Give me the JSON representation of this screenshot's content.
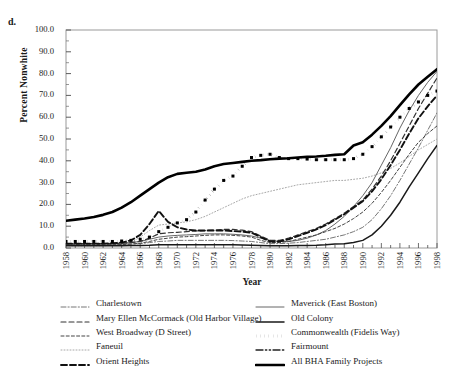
{
  "panel": {
    "label": "d."
  },
  "axes": {
    "ylabel": "Percent Nonwhite",
    "xlabel": "Year",
    "yticks": [
      "0.0",
      "10.0",
      "20.0",
      "30.0",
      "40.0",
      "50.0",
      "60.0",
      "70.0",
      "80.0",
      "90.0",
      "100.0"
    ],
    "xticks": [
      "1958",
      "1960",
      "1962",
      "1964",
      "1966",
      "1968",
      "1970",
      "1972",
      "1974",
      "1976",
      "1978",
      "1980",
      "1982",
      "1984",
      "1986",
      "1988",
      "1990",
      "1992",
      "1994",
      "1996",
      "1998"
    ]
  },
  "legend": {
    "left": [
      {
        "label": "Charlestown",
        "key": "dash-dot-thin"
      },
      {
        "label": "Mary Ellen McCormack (Old Harbor Village)",
        "key": "dash-medium"
      },
      {
        "label": "West Broadway (D Street)",
        "key": "dash-short"
      },
      {
        "label": "Faneuil",
        "key": "dotted-faint"
      },
      {
        "label": "Orient Heights",
        "key": "dash-bold"
      }
    ],
    "right": [
      {
        "label": "Maverick (East Boston)",
        "key": "solid-thin"
      },
      {
        "label": "Old Colony",
        "key": "solid-medium"
      },
      {
        "label": "Commonwealth (Fidelis Way)",
        "key": "dotted-bold"
      },
      {
        "label": "Fairmount",
        "key": "dash-dot-dot"
      },
      {
        "label": "All BHA Family Projects",
        "key": "solid-bold"
      }
    ]
  },
  "chart_data": {
    "type": "line",
    "title": "",
    "xlabel": "Year",
    "ylabel": "Percent Nonwhite",
    "xlim": [
      1958,
      1998
    ],
    "ylim": [
      0,
      100
    ],
    "ytick_step": 10,
    "xtick_step": 2,
    "grid": false,
    "legend_position": "below",
    "x": [
      1958,
      1959,
      1960,
      1961,
      1962,
      1963,
      1964,
      1965,
      1966,
      1967,
      1968,
      1969,
      1970,
      1971,
      1972,
      1973,
      1974,
      1975,
      1976,
      1977,
      1978,
      1979,
      1980,
      1981,
      1982,
      1983,
      1984,
      1985,
      1986,
      1987,
      1988,
      1989,
      1990,
      1991,
      1992,
      1993,
      1994,
      1995,
      1996,
      1997,
      1998
    ],
    "series": [
      {
        "name": "All BHA Family Projects",
        "style": "solid-bold",
        "values": [
          12.5,
          13.0,
          13.5,
          14.2,
          15.2,
          16.5,
          18.5,
          21.0,
          24.0,
          27.0,
          30.0,
          32.5,
          34.0,
          34.5,
          35.0,
          36.0,
          37.5,
          38.5,
          39.0,
          39.5,
          40.0,
          40.3,
          40.7,
          41.0,
          41.2,
          41.5,
          41.8,
          42.0,
          42.3,
          42.7,
          43.0,
          47.0,
          48.5,
          52.0,
          56.0,
          60.5,
          65.5,
          70.5,
          75.0,
          78.5,
          82.0
        ]
      },
      {
        "name": "Commonwealth (Fidelis Way)",
        "style": "dotted-bold",
        "values": [
          3.0,
          3.0,
          3.0,
          3.0,
          3.0,
          3.0,
          3.2,
          3.5,
          4.0,
          5.0,
          7.5,
          9.5,
          11.5,
          13.0,
          16.5,
          22.0,
          27.0,
          31.0,
          33.0,
          37.5,
          41.5,
          42.5,
          43.0,
          41.5,
          41.0,
          41.0,
          40.8,
          40.5,
          40.5,
          40.5,
          40.5,
          41.0,
          43.0,
          46.5,
          51.0,
          55.5,
          60.0,
          64.0,
          67.0,
          70.0,
          72.0
        ]
      },
      {
        "name": "Maverick (East Boston)",
        "style": "solid-thin",
        "values": [
          2.0,
          2.0,
          2.0,
          2.0,
          2.0,
          2.0,
          2.2,
          2.5,
          3.0,
          4.0,
          5.0,
          5.5,
          5.8,
          6.0,
          6.2,
          6.5,
          6.5,
          6.5,
          6.3,
          6.0,
          5.5,
          4.5,
          3.5,
          3.0,
          3.0,
          3.5,
          4.5,
          6.0,
          8.0,
          11.0,
          14.5,
          19.0,
          24.0,
          30.0,
          38.0,
          46.0,
          55.0,
          63.0,
          70.0,
          76.0,
          81.0
        ]
      },
      {
        "name": "Mary Ellen McCormack (Old Harbor Village)",
        "style": "dash-medium",
        "values": [
          2.0,
          2.0,
          2.0,
          2.0,
          2.0,
          2.0,
          2.2,
          2.5,
          3.0,
          4.5,
          6.5,
          7.0,
          7.2,
          7.5,
          7.8,
          8.0,
          8.2,
          8.5,
          8.5,
          8.2,
          7.5,
          5.5,
          3.5,
          3.5,
          4.5,
          6.0,
          7.5,
          9.0,
          11.0,
          13.5,
          16.0,
          19.0,
          22.0,
          27.0,
          33.0,
          40.0,
          48.0,
          56.0,
          64.0,
          71.0,
          78.0
        ]
      },
      {
        "name": "Orient Heights",
        "style": "dash-bold",
        "values": [
          2.0,
          2.0,
          2.0,
          2.0,
          2.0,
          2.2,
          2.5,
          3.5,
          6.0,
          11.0,
          17.0,
          12.0,
          9.5,
          8.5,
          8.0,
          8.0,
          8.0,
          8.0,
          7.8,
          7.5,
          7.0,
          5.0,
          3.0,
          3.0,
          4.0,
          5.5,
          7.0,
          8.5,
          10.5,
          13.0,
          15.5,
          18.5,
          21.5,
          26.0,
          31.5,
          38.0,
          45.0,
          52.5,
          59.5,
          65.0,
          70.0
        ]
      },
      {
        "name": "Charlestown",
        "style": "dash-dot-thin",
        "values": [
          1.5,
          1.5,
          1.5,
          1.5,
          1.5,
          1.5,
          1.6,
          1.8,
          2.0,
          2.5,
          3.0,
          3.2,
          3.5,
          3.5,
          3.5,
          3.5,
          3.5,
          3.5,
          3.4,
          3.2,
          3.0,
          2.5,
          2.0,
          2.0,
          2.2,
          2.5,
          3.0,
          3.5,
          4.0,
          5.0,
          6.0,
          7.5,
          9.5,
          13.0,
          18.0,
          24.0,
          31.0,
          38.5,
          46.0,
          54.0,
          62.0
        ]
      },
      {
        "name": "West Broadway (D Street)",
        "style": "dash-short",
        "values": [
          1.5,
          1.5,
          1.5,
          1.5,
          1.5,
          1.5,
          1.6,
          1.8,
          2.2,
          3.0,
          4.0,
          4.5,
          5.0,
          5.2,
          5.5,
          5.8,
          6.0,
          6.0,
          5.8,
          5.5,
          5.0,
          3.5,
          2.5,
          2.5,
          3.0,
          4.0,
          5.0,
          6.0,
          7.5,
          9.0,
          11.0,
          13.5,
          16.5,
          20.5,
          25.5,
          31.0,
          37.0,
          43.0,
          48.5,
          52.5,
          56.0
        ]
      },
      {
        "name": "Faneuil",
        "style": "dotted-faint",
        "values": [
          1.0,
          1.0,
          1.0,
          1.0,
          1.0,
          1.2,
          1.5,
          2.5,
          5.0,
          8.0,
          10.5,
          11.0,
          11.5,
          12.0,
          13.0,
          14.5,
          16.5,
          18.5,
          20.5,
          22.5,
          24.0,
          25.0,
          26.0,
          27.0,
          28.0,
          29.0,
          29.5,
          30.0,
          30.5,
          31.0,
          31.0,
          31.5,
          32.0,
          33.0,
          34.5,
          36.5,
          39.0,
          42.0,
          45.0,
          47.5,
          50.0
        ]
      },
      {
        "name": "Old Colony",
        "style": "solid-medium",
        "values": [
          1.0,
          1.0,
          1.0,
          1.0,
          1.0,
          1.0,
          1.0,
          1.1,
          1.2,
          1.3,
          1.5,
          1.5,
          1.5,
          1.5,
          1.5,
          1.5,
          1.5,
          1.5,
          1.5,
          1.4,
          1.3,
          1.2,
          1.0,
          1.0,
          1.0,
          1.1,
          1.2,
          1.3,
          1.5,
          1.8,
          2.0,
          2.5,
          3.5,
          6.0,
          10.0,
          15.0,
          21.0,
          28.0,
          34.5,
          41.0,
          47.0
        ]
      }
    ]
  }
}
